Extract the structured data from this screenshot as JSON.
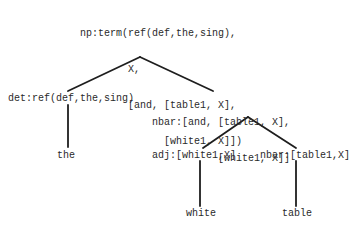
{
  "diagram": {
    "type": "parse-tree",
    "edge_color": "#1e1e1e",
    "text_color": "#2a2a2a",
    "root": {
      "lines": [
        "np:term(ref(def,the,sing),",
        "        X,",
        "        [and, [table1, X],",
        "              [white1, X]])"
      ]
    },
    "det": {
      "label": "det:ref(def,the,sing)",
      "leaf": "the"
    },
    "nbar": {
      "lines": [
        "nbar:[and, [table1, X],",
        "           [white1, X]]"
      ]
    },
    "adj": {
      "label": "adj:[white1,X]",
      "leaf": "white"
    },
    "nbar_table": {
      "label": "nbar:[table1,X]",
      "leaf": "table"
    }
  }
}
